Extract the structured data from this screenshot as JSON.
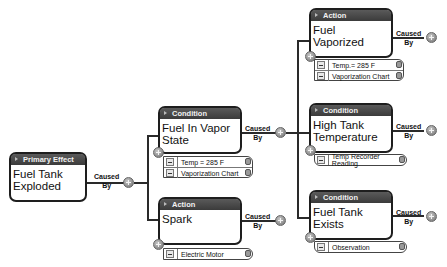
{
  "diagram": {
    "connector_label": "Caused By",
    "connector_label_line1": "Caused",
    "connector_label_line2": "By",
    "nodes": {
      "primary": {
        "type": "Primary Effect",
        "title": "Fuel Tank Exploded"
      },
      "fuel_vapor_state": {
        "type": "Condition",
        "title": "Fuel In Vapor State",
        "evidence": [
          "Temp = 285 F",
          "Vaporization Chart"
        ]
      },
      "spark": {
        "type": "Action",
        "title": "Spark",
        "evidence": [
          "Electric Motor"
        ]
      },
      "fuel_vaporized": {
        "type": "Action",
        "title": "Fuel Vaporized",
        "evidence": [
          "Temp.= 285 F",
          "Vaporization Chart"
        ]
      },
      "high_tank_temp": {
        "type": "Condition",
        "title": "High Tank Temperature",
        "evidence": [
          "Temp Recorder Reading"
        ]
      },
      "fuel_tank_exists": {
        "type": "Condition",
        "title": "Fuel Tank Exists",
        "evidence": [
          "Observation"
        ]
      }
    },
    "edges": [
      {
        "from": "Fuel Tank Exploded",
        "to": "Fuel In Vapor State",
        "label": "Caused By"
      },
      {
        "from": "Fuel Tank Exploded",
        "to": "Spark",
        "label": "Caused By"
      },
      {
        "from": "Fuel In Vapor State",
        "to": "Fuel Vaporized",
        "label": "Caused By"
      },
      {
        "from": "Fuel In Vapor State",
        "to": "High Tank Temperature",
        "label": "Caused By"
      },
      {
        "from": "Fuel In Vapor State",
        "to": "Fuel Tank Exists",
        "label": "Caused By"
      }
    ]
  }
}
